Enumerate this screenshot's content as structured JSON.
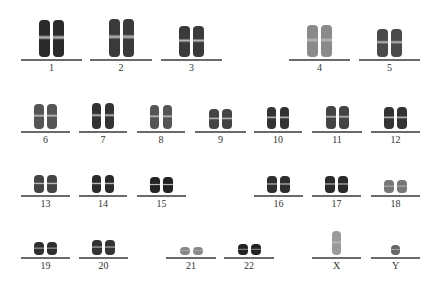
{
  "chromosomes": [
    {
      "label": "1",
      "x": 21,
      "w": 61,
      "lineY": 59,
      "h": 37,
      "shade": "#2a2a2a",
      "tone": "dark"
    },
    {
      "label": "2",
      "x": 90,
      "w": 62,
      "lineY": 59,
      "h": 38,
      "shade": "#3a3a3a",
      "tone": "dark"
    },
    {
      "label": "3",
      "x": 161,
      "w": 61,
      "lineY": 59,
      "h": 31,
      "shade": "#3a3a3a",
      "tone": "dark"
    },
    {
      "label": "4",
      "x": 289,
      "w": 61,
      "lineY": 59,
      "h": 32,
      "shade": "#8a8a8a",
      "tone": "light"
    },
    {
      "label": "5",
      "x": 359,
      "w": 61,
      "lineY": 59,
      "h": 28,
      "shade": "#4a4a4a",
      "tone": "mid"
    },
    {
      "label": "6",
      "x": 21,
      "w": 49,
      "lineY": 131,
      "h": 25,
      "shade": "#555",
      "tone": "mid"
    },
    {
      "label": "7",
      "x": 79,
      "w": 48,
      "lineY": 131,
      "h": 26,
      "shade": "#333",
      "tone": "dark"
    },
    {
      "label": "8",
      "x": 137,
      "w": 48,
      "lineY": 131,
      "h": 24,
      "shade": "#555",
      "tone": "mid"
    },
    {
      "label": "9",
      "x": 195,
      "w": 51,
      "lineY": 131,
      "h": 20,
      "shade": "#444",
      "tone": "mid"
    },
    {
      "label": "10",
      "x": 254,
      "w": 48,
      "lineY": 131,
      "h": 22,
      "shade": "#333",
      "tone": "dark"
    },
    {
      "label": "11",
      "x": 312,
      "w": 50,
      "lineY": 131,
      "h": 23,
      "shade": "#444",
      "tone": "mid"
    },
    {
      "label": "12",
      "x": 371,
      "w": 49,
      "lineY": 131,
      "h": 22,
      "shade": "#333",
      "tone": "dark"
    },
    {
      "label": "13",
      "x": 21,
      "w": 49,
      "lineY": 195,
      "h": 18,
      "shade": "#444",
      "tone": "mid"
    },
    {
      "label": "14",
      "x": 79,
      "w": 48,
      "lineY": 195,
      "h": 18,
      "shade": "#2a2a2a",
      "tone": "dark"
    },
    {
      "label": "15",
      "x": 137,
      "w": 49,
      "lineY": 195,
      "h": 16,
      "shade": "#222",
      "tone": "dark"
    },
    {
      "label": "16",
      "x": 254,
      "w": 49,
      "lineY": 195,
      "h": 17,
      "shade": "#2e2e2e",
      "tone": "dark"
    },
    {
      "label": "17",
      "x": 312,
      "w": 49,
      "lineY": 195,
      "h": 17,
      "shade": "#2a2a2a",
      "tone": "dark"
    },
    {
      "label": "18",
      "x": 371,
      "w": 49,
      "lineY": 195,
      "h": 13,
      "shade": "#777",
      "tone": "light"
    },
    {
      "label": "19",
      "x": 21,
      "w": 49,
      "lineY": 257,
      "h": 13,
      "shade": "#2e2e2e",
      "tone": "dark"
    },
    {
      "label": "20",
      "x": 79,
      "w": 49,
      "lineY": 257,
      "h": 15,
      "shade": "#333",
      "tone": "dark"
    },
    {
      "label": "21",
      "x": 166,
      "w": 50,
      "lineY": 257,
      "h": 8,
      "shade": "#888",
      "tone": "light"
    },
    {
      "label": "22",
      "x": 224,
      "w": 50,
      "lineY": 257,
      "h": 11,
      "shade": "#222",
      "tone": "dark"
    },
    {
      "label": "X",
      "x": 312,
      "w": 49,
      "lineY": 257,
      "h": 24,
      "shade": "#9a9a9a",
      "tone": "light",
      "single": true
    },
    {
      "label": "Y",
      "x": 371,
      "w": 49,
      "lineY": 257,
      "h": 10,
      "shade": "#666",
      "tone": "mid",
      "single": true
    }
  ]
}
